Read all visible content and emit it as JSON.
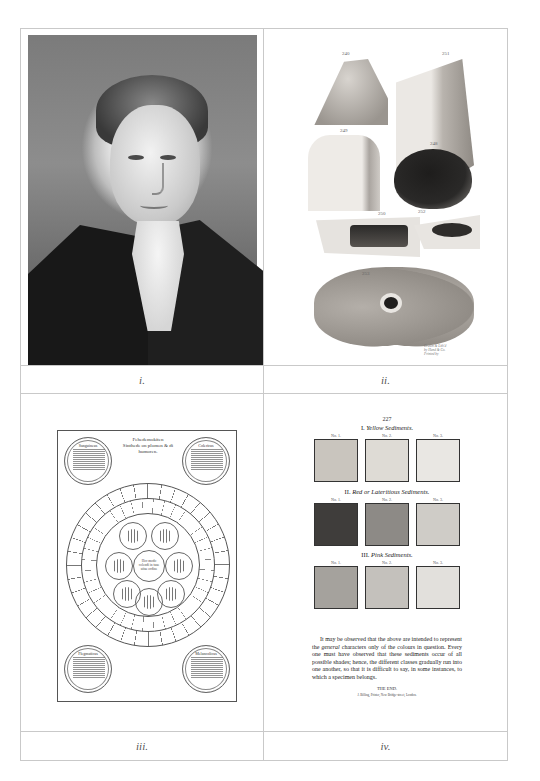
{
  "plates": [
    {
      "caption": "i.",
      "subject": "Engraved portrait of a young man in a dark coat with white cravat"
    },
    {
      "caption": "ii.",
      "subject": "Anatomical lithograph of brain specimens",
      "figure_numbers": [
        "240",
        "251",
        "249",
        "248",
        "250",
        "252",
        "253"
      ],
      "credit_lines": [
        "Drawn & Lith'd",
        "by Hand & Co.",
        "Printed by"
      ]
    },
    {
      "caption": "iii.",
      "subject": "Circular diagram of the four temperaments",
      "title_lines": [
        "Fehedemokiten",
        "Sinthede on plomen & di",
        "humoren."
      ],
      "corner_circles": [
        "Sanguineus",
        "Colericus",
        "Flegmaticus",
        "Melancolicus"
      ],
      "center_text": "Hoc modo colendi in tuae uitae ordine"
    },
    {
      "caption": "iv.",
      "subject": "Colour plate of urinary sediments",
      "page_number": "227",
      "sections": [
        {
          "numeral": "I.",
          "title": "Yellow Sediments.",
          "labels": [
            "No. 1.",
            "No. 2.",
            "No. 3."
          ],
          "colors": [
            "#c9c5be",
            "#dedbd5",
            "#e9e7e3"
          ]
        },
        {
          "numeral": "II.",
          "title": "Red or Lateritious Sediments.",
          "labels": [
            "No. 1.",
            "No. 2.",
            "No. 3."
          ],
          "colors": [
            "#3f3d3b",
            "#8d8a86",
            "#cfccc7"
          ]
        },
        {
          "numeral": "III.",
          "title": "Pink Sediments.",
          "labels": [
            "No. 1.",
            "No. 2.",
            "No. 3."
          ],
          "colors": [
            "#a5a29d",
            "#c4c1bc",
            "#e2e0dc"
          ]
        }
      ],
      "body_text_pre": "It may be observed that the above are intended to represent the ",
      "body_text_italic": "general",
      "body_text_post": " characters only of the colours in question. Every one must have observed that these sediments occur of all possible shades; hence, the different classes gradually run into one another, so that it is difficult to say, in some instances, to which a specimen belongs.",
      "end_text": "THE END.",
      "printer_line": "J. Billing, Printer, New Bridge-street, London."
    }
  ],
  "colors": {
    "grid_border": "#c9c9c9",
    "caption_text": "#555555",
    "background": "#ffffff"
  }
}
